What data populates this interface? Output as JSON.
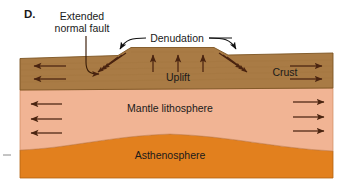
{
  "figure": {
    "panel_label": "D.",
    "type": "geologic-cross-section",
    "caption_absent": true
  },
  "colors": {
    "crust": "#a97b45",
    "crust_edge": "#7d5522",
    "mantle_lithosphere": "#f1b494",
    "mantle_edge": "#c98156",
    "asthenosphere": "#e2801e",
    "asthenosphere_edge": "#b15f12",
    "arrow": "#4a2410",
    "text": "#1a1a1a",
    "leader": "#3a1d08",
    "background": "#ffffff"
  },
  "layers": [
    {
      "id": "crust",
      "label": "Crust",
      "label_x": 286,
      "label_y": 76
    },
    {
      "id": "mantle-lithosphere",
      "label": "Mantle lithosphere",
      "label_x": 170,
      "label_y": 109
    },
    {
      "id": "asthenosphere",
      "label": "Asthenosphere",
      "label_x": 170,
      "label_y": 156
    }
  ],
  "annotations": [
    {
      "id": "extended-normal-fault",
      "label_line1": "Extended",
      "label_line2": "normal fault",
      "label_x": 82,
      "label_y1": 19,
      "label_y2": 31,
      "leader_target": "left-fault-zone"
    },
    {
      "id": "denudation",
      "label": "Denudation",
      "label_x": 176,
      "label_y": 41,
      "leader_targets": [
        "left-shoulder",
        "right-shoulder"
      ]
    },
    {
      "id": "uplift",
      "label": "Uplift",
      "label_x": 176,
      "label_y": 78,
      "arrow_count": 3,
      "arrow_direction": "up"
    }
  ],
  "extension_arrows": {
    "crust_left": {
      "count": 2,
      "direction": "left"
    },
    "crust_right": {
      "count": 2,
      "direction": "right"
    },
    "mantle_left": {
      "count": 3,
      "direction": "left"
    },
    "mantle_right": {
      "count": 3,
      "direction": "right"
    }
  },
  "fault_sets": [
    {
      "id": "left-fault-zone",
      "count": 3,
      "dip": "down-left",
      "x_center": 112,
      "y_center": 63
    },
    {
      "id": "right-fault-zone",
      "count": 3,
      "dip": "down-right",
      "x_center": 232,
      "y_center": 63
    }
  ],
  "tick_mark": {
    "id": "left-edge-tick",
    "x": 6,
    "y": 155
  }
}
